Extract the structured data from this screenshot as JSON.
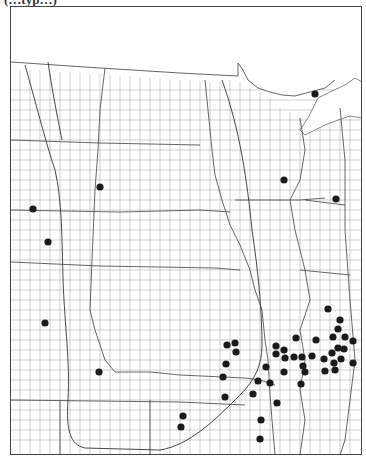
{
  "page": {
    "cut_top_text": "(…typ…)"
  },
  "header": {
    "number": "17.",
    "genus_species": "Asplenium trichomanes",
    "authority": "L.",
    "common_name": "Maidenhair Spleenwort"
  },
  "map": {
    "region": "Great Plains and adjacent states, county outline map",
    "colors": {
      "border": "#444444",
      "county": "#9a9a9a",
      "state": "#555555",
      "dot": "#1a1a1a",
      "curve": "#333333"
    },
    "occurrence_dots": [
      [
        315,
        94
      ],
      [
        284,
        180
      ],
      [
        336,
        199
      ],
      [
        33,
        209
      ],
      [
        100,
        187
      ],
      [
        48,
        242
      ],
      [
        45,
        323
      ],
      [
        99,
        372
      ],
      [
        227,
        345
      ],
      [
        235,
        343
      ],
      [
        236,
        352
      ],
      [
        226,
        364
      ],
      [
        223,
        377
      ],
      [
        225,
        397
      ],
      [
        183,
        416
      ],
      [
        181,
        427
      ],
      [
        258,
        381
      ],
      [
        253,
        394
      ],
      [
        261,
        420
      ],
      [
        260,
        439
      ],
      [
        328,
        309
      ],
      [
        340,
        320
      ],
      [
        338,
        329
      ],
      [
        296,
        338
      ],
      [
        316,
        340
      ],
      [
        333,
        337
      ],
      [
        345,
        337
      ],
      [
        353,
        341
      ],
      [
        276,
        346
      ],
      [
        284,
        350
      ],
      [
        276,
        354
      ],
      [
        338,
        348
      ],
      [
        344,
        349
      ],
      [
        332,
        353
      ],
      [
        285,
        358
      ],
      [
        294,
        357
      ],
      [
        302,
        357
      ],
      [
        312,
        356
      ],
      [
        324,
        359
      ],
      [
        341,
        359
      ],
      [
        334,
        363
      ],
      [
        353,
        363
      ],
      [
        266,
        367
      ],
      [
        303,
        366
      ],
      [
        284,
        372
      ],
      [
        305,
        372
      ],
      [
        325,
        371
      ],
      [
        335,
        370
      ],
      [
        270,
        383
      ],
      [
        301,
        384
      ],
      [
        277,
        403
      ]
    ]
  }
}
